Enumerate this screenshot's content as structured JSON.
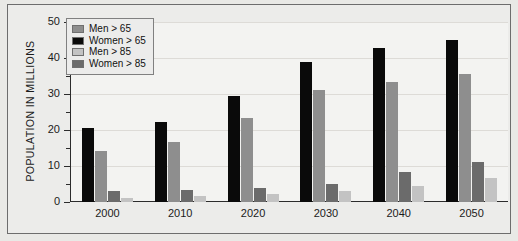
{
  "chart_data": {
    "type": "bar",
    "title": "",
    "xlabel": "",
    "ylabel": "POPULATION IN MILLIONS",
    "ylim": [
      0,
      50
    ],
    "yticks": [
      0,
      10,
      20,
      30,
      40,
      50
    ],
    "yminorticks": [
      5,
      15,
      25,
      35,
      45
    ],
    "grid": true,
    "legend_position": "top-left",
    "categories": [
      "2000",
      "2010",
      "2020",
      "2030",
      "2040",
      "2050"
    ],
    "series": [
      {
        "name": "Women > 65",
        "color": "#0a0a0a",
        "values": [
          20.5,
          22.2,
          29.5,
          38.8,
          42.7,
          45.0
        ]
      },
      {
        "name": "Men > 65",
        "color": "#8e8e8e",
        "values": [
          14.3,
          16.8,
          23.4,
          31.0,
          33.3,
          35.5
        ]
      },
      {
        "name": "Women > 85",
        "color": "#6b6b6b",
        "values": [
          3.0,
          3.4,
          4.0,
          4.9,
          8.2,
          11.0
        ]
      },
      {
        "name": "Men > 85",
        "color": "#c3c3c3",
        "values": [
          1.0,
          1.7,
          2.1,
          3.0,
          4.5,
          6.6
        ]
      }
    ],
    "bar_draw_order": [
      "Women > 65",
      "Men > 65",
      "Women > 85",
      "Men > 85"
    ],
    "legend_order": [
      "Men > 65",
      "Women > 65",
      "Men > 85",
      "Women > 85"
    ]
  },
  "legend": {
    "items": [
      {
        "label": "Men > 65",
        "series": "Men > 65"
      },
      {
        "label": "Women > 65",
        "series": "Women > 65"
      },
      {
        "label": "Men > 85",
        "series": "Men > 85"
      },
      {
        "label": "Women > 85",
        "series": "Women > 85"
      }
    ]
  }
}
